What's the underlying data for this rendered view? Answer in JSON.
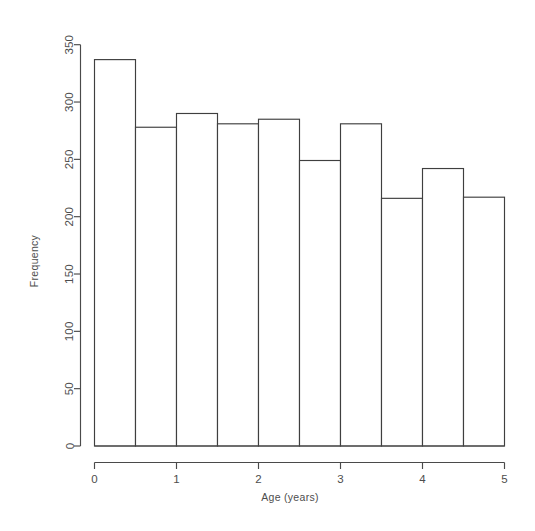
{
  "chart_data": {
    "type": "bar",
    "subtype": "histogram",
    "title": "",
    "subtitle": "",
    "xlabel": "Age (years)",
    "ylabel": "Frequency",
    "xlim": [
      0,
      5
    ],
    "ylim": [
      0,
      350
    ],
    "binwidth": 0.5,
    "grid": false,
    "legend": null,
    "categories": [
      "0-0.5",
      "0.5-1",
      "1-1.5",
      "1.5-2",
      "2-2.5",
      "2.5-3",
      "3-3.5",
      "3.5-4",
      "4-4.5",
      "4.5-5"
    ],
    "bin_edges": [
      0,
      0.5,
      1,
      1.5,
      2,
      2.5,
      3,
      3.5,
      4,
      4.5,
      5
    ],
    "values": [
      337,
      278,
      290,
      281,
      285,
      249,
      281,
      216,
      242,
      217
    ],
    "x_ticks": [
      0,
      1,
      2,
      3,
      4,
      5
    ],
    "x_tick_labels": [
      "0",
      "1",
      "2",
      "3",
      "4",
      "5"
    ],
    "y_ticks": [
      0,
      50,
      100,
      150,
      200,
      250,
      300,
      350
    ],
    "y_tick_labels": [
      "0",
      "50",
      "100",
      "150",
      "200",
      "250",
      "300",
      "350"
    ],
    "bar_fill": "#ffffff",
    "bar_stroke": "#3f3f3f",
    "axis_color": "#4a4a4a",
    "background": "#ffffff"
  },
  "figure": {
    "x_axis_title": "Age (years)",
    "y_axis_title": "Frequency"
  }
}
